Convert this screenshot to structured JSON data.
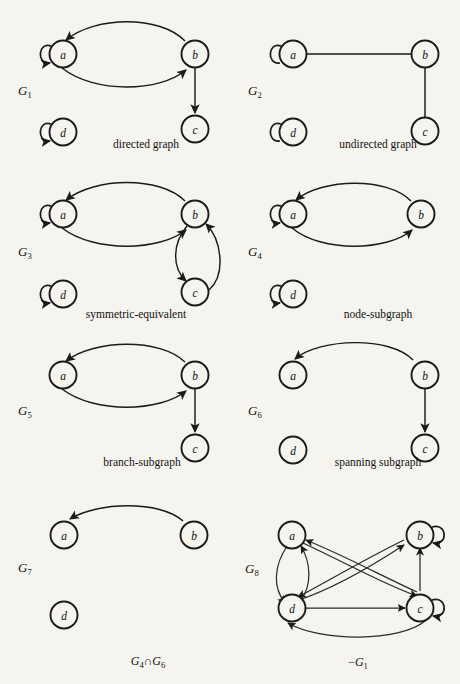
{
  "page": {
    "background_color": "#f6f4ef",
    "ink_color": "#1a1a1a",
    "width": 460,
    "height": 684,
    "ghost_header_left": "",
    "ghost_header_right": ""
  },
  "node_labels": {
    "a": "a",
    "b": "b",
    "c": "c",
    "d": "d"
  },
  "figures": [
    {
      "id": "G1",
      "name": "G",
      "subscript": "1",
      "caption": "directed graph",
      "nodes": [
        "a",
        "b",
        "c",
        "d"
      ],
      "self_loops": [
        "a",
        "d"
      ],
      "edges": [
        {
          "from": "b",
          "to": "a",
          "style": "arc-up",
          "directed": true
        },
        {
          "from": "a",
          "to": "b",
          "style": "arc-down",
          "directed": true
        },
        {
          "from": "b",
          "to": "c",
          "style": "straight",
          "directed": true
        }
      ]
    },
    {
      "id": "G2",
      "name": "G",
      "subscript": "2",
      "caption": "undirected graph",
      "nodes": [
        "a",
        "b",
        "c",
        "d"
      ],
      "self_loops": [
        "a",
        "d"
      ],
      "edges": [
        {
          "from": "a",
          "to": "b",
          "style": "straight",
          "directed": false
        },
        {
          "from": "b",
          "to": "c",
          "style": "straight",
          "directed": false
        }
      ]
    },
    {
      "id": "G3",
      "name": "G",
      "subscript": "3",
      "caption": "symmetric-equivalent",
      "nodes": [
        "a",
        "b",
        "c",
        "d"
      ],
      "self_loops": [
        "a",
        "d"
      ],
      "edges": [
        {
          "from": "b",
          "to": "a",
          "style": "arc-up",
          "directed": true
        },
        {
          "from": "a",
          "to": "b",
          "style": "arc-down",
          "directed": true
        },
        {
          "from": "b",
          "to": "c",
          "style": "arc-left",
          "directed": true
        },
        {
          "from": "c",
          "to": "b",
          "style": "arc-right",
          "directed": true
        }
      ]
    },
    {
      "id": "G4",
      "name": "G",
      "subscript": "4",
      "caption": "node-subgraph",
      "nodes": [
        "a",
        "b",
        "d"
      ],
      "self_loops": [
        "a",
        "d"
      ],
      "edges": [
        {
          "from": "b",
          "to": "a",
          "style": "arc-up",
          "directed": true
        },
        {
          "from": "a",
          "to": "b",
          "style": "arc-down",
          "directed": true
        }
      ]
    },
    {
      "id": "G5",
      "name": "G",
      "subscript": "5",
      "caption": "branch-subgraph",
      "nodes": [
        "a",
        "b",
        "c"
      ],
      "self_loops": [],
      "edges": [
        {
          "from": "b",
          "to": "a",
          "style": "arc-up",
          "directed": true
        },
        {
          "from": "a",
          "to": "b",
          "style": "arc-down",
          "directed": true
        },
        {
          "from": "b",
          "to": "c",
          "style": "straight",
          "directed": true
        }
      ]
    },
    {
      "id": "G6",
      "name": "G",
      "subscript": "6",
      "caption": "spanning subgraph",
      "nodes": [
        "a",
        "b",
        "c",
        "d"
      ],
      "self_loops": [],
      "edges": [
        {
          "from": "b",
          "to": "a",
          "style": "arc-up",
          "directed": true
        },
        {
          "from": "b",
          "to": "c",
          "style": "straight",
          "directed": true
        }
      ]
    },
    {
      "id": "G7",
      "name": "G",
      "subscript": "7",
      "caption": "",
      "bottom_caption_parts": [
        "G",
        "4",
        "∩",
        "G",
        "6"
      ],
      "nodes": [
        "a",
        "b",
        "d"
      ],
      "self_loops": [],
      "edges": [
        {
          "from": "b",
          "to": "a",
          "style": "arc-up",
          "directed": true
        }
      ]
    },
    {
      "id": "G8",
      "name": "G",
      "subscript": "8",
      "caption": "",
      "bottom_caption_parts": [
        "−",
        "G",
        "1"
      ],
      "nodes": [
        "a",
        "b",
        "c",
        "d"
      ],
      "self_loops": [
        "b",
        "c"
      ],
      "edges": [
        {
          "from": "a",
          "to": "d",
          "style": "arc-left",
          "directed": true
        },
        {
          "from": "d",
          "to": "a",
          "style": "arc-right",
          "directed": true
        },
        {
          "from": "a",
          "to": "c",
          "style": "diagonal",
          "directed": true
        },
        {
          "from": "c",
          "to": "a",
          "style": "diagonal",
          "directed": true
        },
        {
          "from": "b",
          "to": "d",
          "style": "diagonal",
          "directed": true
        },
        {
          "from": "d",
          "to": "b",
          "style": "diagonal",
          "directed": true
        },
        {
          "from": "c",
          "to": "b",
          "style": "straight",
          "directed": true
        },
        {
          "from": "d",
          "to": "c",
          "style": "straight",
          "directed": true
        },
        {
          "from": "c",
          "to": "d",
          "style": "arc-bottom",
          "directed": true
        }
      ]
    }
  ],
  "captions": {
    "g1": "directed graph",
    "g2": "undirected graph",
    "g3": "symmetric-equivalent",
    "g4": "node-subgraph",
    "g5": "branch-subgraph",
    "g6": "spanning subgraph",
    "g7_bottom": "G4∩G6",
    "g8_bottom": "−G1"
  }
}
